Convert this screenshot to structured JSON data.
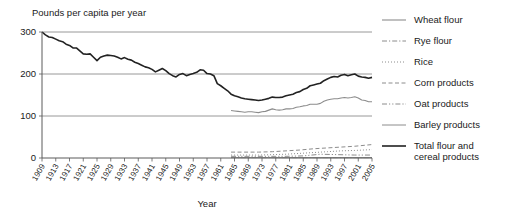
{
  "chart_data": {
    "type": "line",
    "title": "",
    "ylabel": "Pounds per capita per year",
    "xlabel": "Year",
    "ylim": [
      0,
      300
    ],
    "yticks": [
      0,
      100,
      200,
      300
    ],
    "ytick_labels": [
      "0",
      "100",
      "200",
      "300"
    ],
    "grid": true,
    "gridlines_at": [
      100,
      200,
      300
    ],
    "xlim": [
      1909,
      2005
    ],
    "xticks": [
      1909,
      1913,
      1917,
      1921,
      1925,
      1929,
      1933,
      1937,
      1941,
      1945,
      1949,
      1953,
      1957,
      1961,
      1965,
      1969,
      1973,
      1977,
      1981,
      1985,
      1989,
      1993,
      1997,
      2001,
      2005
    ],
    "xtick_labels": [
      "1909",
      "1913",
      "1917",
      "1921",
      "1925",
      "1929",
      "1933",
      "1937",
      "1941",
      "1945",
      "1949",
      "1953",
      "1957",
      "1961",
      "1965",
      "1969",
      "1973",
      "1977",
      "1981",
      "1985",
      "1989",
      "1993",
      "1997",
      "2001",
      "2005"
    ],
    "legend_position": "right",
    "series": [
      {
        "name": "Wheat flour",
        "style": "solid",
        "color": "#8c8c8c",
        "width": 1.1,
        "x": [
          1964,
          1965,
          1966,
          1967,
          1968,
          1969,
          1970,
          1971,
          1972,
          1973,
          1974,
          1975,
          1976,
          1977,
          1978,
          1979,
          1980,
          1981,
          1982,
          1983,
          1984,
          1985,
          1986,
          1987,
          1988,
          1989,
          1990,
          1991,
          1992,
          1993,
          1994,
          1995,
          1996,
          1997,
          1998,
          1999,
          2000,
          2001,
          2002,
          2003,
          2004,
          2005
        ],
        "values": [
          113,
          112,
          111,
          110,
          109,
          110,
          110,
          109,
          108,
          110,
          111,
          114,
          117,
          115,
          114,
          115,
          117,
          117,
          118,
          121,
          122,
          124,
          125,
          128,
          128,
          128,
          130,
          135,
          138,
          140,
          141,
          141,
          143,
          144,
          143,
          144,
          146,
          143,
          138,
          137,
          134,
          134
        ]
      },
      {
        "name": "Rye flour",
        "style": "dashdot",
        "color": "#8c8c8c",
        "width": 1.0,
        "x": [
          1964,
          1970,
          1975,
          1980,
          1985,
          1990,
          1995,
          2000,
          2005
        ],
        "values": [
          1,
          1,
          1,
          1,
          1,
          1,
          1,
          1,
          1
        ]
      },
      {
        "name": "Rice",
        "style": "dotted",
        "color": "#8c8c8c",
        "width": 1.0,
        "x": [
          1964,
          1968,
          1972,
          1976,
          1980,
          1984,
          1988,
          1992,
          1996,
          2000,
          2005
        ],
        "values": [
          7,
          7,
          7,
          8,
          9,
          11,
          13,
          15,
          17,
          18,
          20
        ]
      },
      {
        "name": "Corn products",
        "style": "dashed",
        "color": "#8c8c8c",
        "width": 1.0,
        "x": [
          1964,
          1968,
          1972,
          1976,
          1980,
          1984,
          1988,
          1992,
          1996,
          2000,
          2005
        ],
        "values": [
          14,
          14,
          14,
          15,
          17,
          19,
          22,
          24,
          26,
          28,
          32
        ]
      },
      {
        "name": "Oat products",
        "style": "dashdotdot",
        "color": "#8c8c8c",
        "width": 1.0,
        "x": [
          1964,
          1970,
          1975,
          1980,
          1985,
          1990,
          1995,
          2000,
          2005
        ],
        "values": [
          4,
          4,
          4,
          4,
          5,
          9,
          8,
          7,
          7
        ]
      },
      {
        "name": "Barley products",
        "style": "solid",
        "color": "#8c8c8c",
        "width": 1.0,
        "x": [
          1964,
          1970,
          1975,
          1980,
          1985,
          1990,
          1995,
          2000,
          2005
        ],
        "values": [
          1,
          1,
          1,
          1,
          1,
          1,
          1,
          1,
          1
        ]
      },
      {
        "name": "Total flour and cereal products",
        "style": "solid",
        "color": "#222222",
        "width": 1.6,
        "x": [
          1909,
          1910,
          1911,
          1912,
          1913,
          1914,
          1915,
          1916,
          1917,
          1918,
          1919,
          1920,
          1921,
          1922,
          1923,
          1924,
          1925,
          1926,
          1927,
          1928,
          1929,
          1930,
          1931,
          1932,
          1933,
          1934,
          1935,
          1936,
          1937,
          1938,
          1939,
          1940,
          1941,
          1942,
          1943,
          1944,
          1945,
          1946,
          1947,
          1948,
          1949,
          1950,
          1951,
          1952,
          1953,
          1954,
          1955,
          1956,
          1957,
          1958,
          1959,
          1960,
          1961,
          1962,
          1963,
          1964,
          1965,
          1966,
          1967,
          1968,
          1969,
          1970,
          1971,
          1972,
          1973,
          1974,
          1975,
          1976,
          1977,
          1978,
          1979,
          1980,
          1981,
          1982,
          1983,
          1984,
          1985,
          1986,
          1987,
          1988,
          1989,
          1990,
          1991,
          1992,
          1993,
          1994,
          1995,
          1996,
          1997,
          1998,
          1999,
          2000,
          2001,
          2002,
          2003,
          2004,
          2005
        ],
        "values": [
          300,
          293,
          288,
          287,
          283,
          279,
          277,
          271,
          268,
          262,
          262,
          255,
          248,
          247,
          248,
          240,
          232,
          240,
          243,
          245,
          244,
          243,
          240,
          236,
          239,
          235,
          233,
          228,
          225,
          221,
          217,
          215,
          211,
          205,
          209,
          213,
          208,
          201,
          196,
          193,
          199,
          201,
          196,
          199,
          201,
          204,
          210,
          209,
          201,
          200,
          196,
          177,
          172,
          166,
          160,
          152,
          148,
          146,
          143,
          141,
          140,
          139,
          138,
          137,
          138,
          140,
          142,
          145,
          144,
          144,
          145,
          148,
          150,
          152,
          156,
          158,
          163,
          166,
          172,
          174,
          176,
          178,
          184,
          188,
          192,
          194,
          193,
          197,
          199,
          196,
          198,
          200,
          195,
          193,
          192,
          190,
          192
        ]
      }
    ]
  },
  "legend": {
    "items": [
      {
        "label": "Wheat flour"
      },
      {
        "label": "Rye flour"
      },
      {
        "label": "Rice"
      },
      {
        "label": "Corn products"
      },
      {
        "label": "Oat products"
      },
      {
        "label": "Barley products"
      },
      {
        "label": "Total flour and",
        "label2": "cereal products"
      }
    ]
  }
}
